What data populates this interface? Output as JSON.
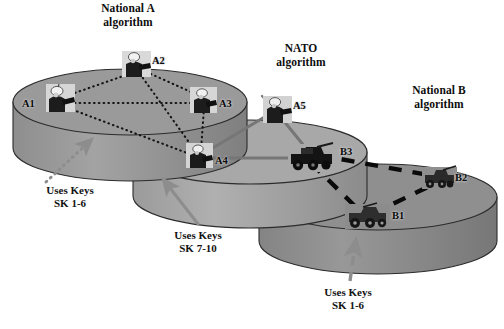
{
  "figure": {
    "background_color": "#ffffff"
  },
  "colors": {
    "cylinder_fill": "#9a9a9a",
    "cylinder_fill_mid": "#a8a8a8",
    "cylinder_fill_right": "#8f8f8f",
    "cylinder_side": "#8a8a8a",
    "outline": "#2b2b2b",
    "national_link": "#141414",
    "nato_link": "#6f6f6f",
    "nationalb_link": "#0a0a0a",
    "arrow_gray": "#8d8d8d",
    "text": "#0d0d0d"
  },
  "domains": [
    {
      "id": "national-a",
      "caption": "National A\nalgorithm",
      "caption_x": 82,
      "caption_y": 2,
      "cx": 130,
      "cy": 102,
      "rx": 117,
      "ry": 33,
      "height": 46,
      "fill": "#9a9a9a",
      "link_style": "dotted",
      "keys": {
        "text": "Uses Keys\nSK 1-6",
        "x": 24,
        "y": 184
      }
    },
    {
      "id": "nato",
      "caption": "NATO\nalgorithm",
      "caption_x": 262,
      "caption_y": 42,
      "cx": 250,
      "cy": 152,
      "rx": 117,
      "ry": 32,
      "height": 44,
      "fill": "#a8a8a8",
      "link_style": "solid-gray",
      "keys": {
        "text": "Uses Keys\nSK 7-10",
        "x": 150,
        "y": 229
      }
    },
    {
      "id": "national-b",
      "caption": "National B\nalgorithm",
      "caption_x": 393,
      "caption_y": 84,
      "cx": 378,
      "cy": 197,
      "rx": 119,
      "ry": 33,
      "height": 44,
      "fill": "#8f8f8f",
      "link_style": "thick-dashed",
      "keys": {
        "text": "Uses Keys\nSK 1-6",
        "x": 302,
        "y": 286
      }
    }
  ],
  "nodes": [
    {
      "id": "A1",
      "label": "A1",
      "type": "soldier",
      "x": 60,
      "y": 100,
      "label_x": 22,
      "label_y": 98,
      "domain": "national-a"
    },
    {
      "id": "A2",
      "label": "A2",
      "type": "soldier",
      "x": 136,
      "y": 65,
      "label_x": 152,
      "label_y": 55,
      "domain": "national-a"
    },
    {
      "id": "A3",
      "label": "A3",
      "type": "soldier",
      "x": 203,
      "y": 101,
      "label_x": 219,
      "label_y": 98,
      "domain": "national-a"
    },
    {
      "id": "A4",
      "label": "A4",
      "type": "soldier",
      "x": 199,
      "y": 156,
      "label_x": 215,
      "label_y": 155,
      "domain": "nato"
    },
    {
      "id": "A5",
      "label": "A5",
      "type": "soldier",
      "x": 277,
      "y": 110,
      "label_x": 293,
      "label_y": 100,
      "domain": "nato"
    },
    {
      "id": "B3",
      "label": "B3",
      "type": "vehicle",
      "x": 311,
      "y": 158,
      "label_x": 340,
      "label_y": 146,
      "domain": "national-b"
    },
    {
      "id": "B2",
      "label": "B2",
      "type": "vehicle",
      "x": 439,
      "y": 178,
      "label_x": 455,
      "label_y": 172,
      "domain": "national-b"
    },
    {
      "id": "B1",
      "label": "B1",
      "type": "vehicle",
      "x": 367,
      "y": 216,
      "label_x": 392,
      "label_y": 210,
      "domain": "national-b"
    }
  ],
  "links": [
    {
      "from": "A1",
      "to": "A2",
      "style": "dotted",
      "group": "national-a"
    },
    {
      "from": "A1",
      "to": "A3",
      "style": "dotted",
      "group": "national-a"
    },
    {
      "from": "A2",
      "to": "A3",
      "style": "dotted",
      "group": "national-a"
    },
    {
      "from": "A2",
      "to": "A4",
      "style": "dotted",
      "group": "national-a"
    },
    {
      "from": "A3",
      "to": "A4",
      "style": "dotted",
      "group": "national-a"
    },
    {
      "from": "A1",
      "to": "A4",
      "style": "dotted",
      "group": "national-a"
    },
    {
      "from": "A4",
      "to": "A5",
      "style": "solid-gray",
      "group": "nato"
    },
    {
      "from": "A4",
      "to": "B3",
      "style": "solid-gray",
      "group": "nato"
    },
    {
      "from": "A5",
      "to": "B3",
      "style": "solid-gray",
      "group": "nato"
    },
    {
      "from": "B3",
      "to": "B2",
      "style": "thick-dashed",
      "group": "national-b"
    },
    {
      "from": "B3",
      "to": "B1",
      "style": "thick-dashed",
      "group": "national-b"
    },
    {
      "from": "B1",
      "to": "B2",
      "style": "thick-dashed",
      "group": "national-b"
    }
  ],
  "callout_arrows": [
    {
      "id": "arrow-national-a",
      "style": "dotted-gray",
      "x1": 46,
      "y1": 182,
      "x2": 92,
      "y2": 139
    },
    {
      "id": "arrow-nato",
      "style": "solid-gray",
      "x1": 198,
      "y1": 224,
      "x2": 162,
      "y2": 178
    },
    {
      "id": "arrow-national-b",
      "style": "dashed-gray",
      "x1": 350,
      "y1": 281,
      "x2": 356,
      "y2": 238
    }
  ]
}
